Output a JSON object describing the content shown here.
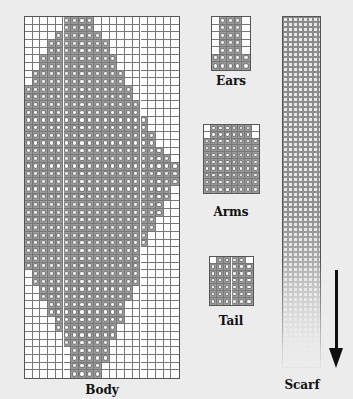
{
  "labels": {
    "body": "Body",
    "ears": "Ears",
    "arms": "Arms",
    "tail": "Tail",
    "scarf": "Scarf"
  },
  "colors": {
    "background": "#ececec",
    "grid_line": "#777777",
    "stitch_fill": "#9a9a9a",
    "arrow": "#111111"
  },
  "patterns": {
    "body": {
      "cols": 20,
      "rows": 47,
      "row_ranges": [
        [
          5,
          8
        ],
        [
          5,
          8
        ],
        [
          4,
          9
        ],
        [
          3,
          10
        ],
        [
          3,
          10
        ],
        [
          2,
          11
        ],
        [
          2,
          11
        ],
        [
          1,
          12
        ],
        [
          1,
          12
        ],
        [
          0,
          13
        ],
        [
          0,
          13
        ],
        [
          0,
          14
        ],
        [
          0,
          14
        ],
        [
          0,
          15
        ],
        [
          0,
          15
        ],
        [
          0,
          16
        ],
        [
          0,
          16
        ],
        [
          0,
          17
        ],
        [
          0,
          18
        ],
        [
          0,
          19
        ],
        [
          0,
          19
        ],
        [
          0,
          19
        ],
        [
          0,
          18
        ],
        [
          0,
          18
        ],
        [
          0,
          17
        ],
        [
          0,
          17
        ],
        [
          0,
          16
        ],
        [
          0,
          16
        ],
        [
          0,
          15
        ],
        [
          0,
          15
        ],
        [
          0,
          14
        ],
        [
          0,
          14
        ],
        [
          0,
          14
        ],
        [
          1,
          14
        ],
        [
          1,
          14
        ],
        [
          2,
          13
        ],
        [
          2,
          13
        ],
        [
          3,
          12
        ],
        [
          3,
          12
        ],
        [
          4,
          12
        ],
        [
          4,
          11
        ],
        [
          5,
          11
        ],
        [
          5,
          10
        ],
        [
          6,
          10
        ],
        [
          6,
          10
        ],
        [
          6,
          9
        ],
        [
          6,
          9
        ]
      ]
    },
    "ears": {
      "cols": 5,
      "rows": 7,
      "row_ranges": [
        [
          1,
          3
        ],
        [
          1,
          3
        ],
        [
          1,
          3
        ],
        [
          1,
          3
        ],
        [
          1,
          3
        ],
        [
          0,
          4
        ],
        [
          0,
          4
        ]
      ]
    },
    "arms": {
      "cols": 8,
      "rows": 10,
      "row_ranges": [
        [
          1,
          6
        ],
        [
          1,
          6
        ],
        [
          0,
          7
        ],
        [
          0,
          7
        ],
        [
          0,
          7
        ],
        [
          0,
          7
        ],
        [
          0,
          7
        ],
        [
          0,
          7
        ],
        [
          0,
          7
        ],
        [
          0,
          7
        ]
      ]
    },
    "tail": {
      "cols": 6,
      "rows": 7,
      "row_ranges": [
        [
          1,
          4
        ],
        [
          0,
          5
        ],
        [
          0,
          5
        ],
        [
          0,
          5
        ],
        [
          0,
          5
        ],
        [
          0,
          5
        ],
        [
          0,
          5
        ]
      ]
    }
  },
  "scarf": {
    "direction": "down",
    "arrow_icon": "arrow-down-icon"
  }
}
